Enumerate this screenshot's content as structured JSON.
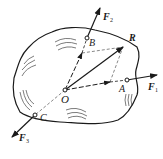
{
  "diagram": {
    "origin": {
      "label": "O",
      "x": 65,
      "y": 90
    },
    "points": [
      {
        "id": "A",
        "label": "A",
        "x": 127,
        "y": 80
      },
      {
        "id": "B",
        "label": "B",
        "x": 87,
        "y": 38
      },
      {
        "id": "C",
        "label": "C",
        "x": 35,
        "y": 115
      }
    ],
    "forces": [
      {
        "id": "F1",
        "symbol": "F",
        "subscript": "1",
        "at": "A",
        "tip": [
          157,
          75
        ]
      },
      {
        "id": "F2",
        "symbol": "F",
        "subscript": "2",
        "at": "B",
        "tip": [
          100,
          8
        ]
      },
      {
        "id": "F3",
        "symbol": "F",
        "subscript": "3",
        "at": "C",
        "tip": [
          12,
          137
        ]
      }
    ],
    "resultant": {
      "symbol": "R",
      "tip": [
        123,
        47
      ]
    },
    "colors": {
      "ink": "#1a1a1a",
      "dashed": "#555555",
      "background": "#ffffff"
    }
  }
}
